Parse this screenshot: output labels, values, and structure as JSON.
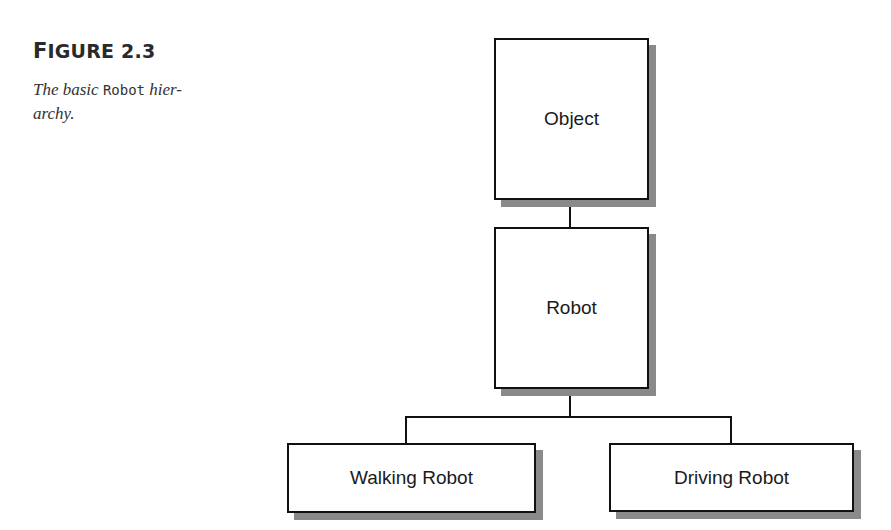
{
  "figure": {
    "label_initial": "F",
    "label_rest": "IGURE 2.3",
    "caption_before": "The basic ",
    "caption_code": "Robot",
    "caption_after": " hier-archy."
  },
  "diagram": {
    "nodes": [
      {
        "id": "object",
        "label": "Object"
      },
      {
        "id": "robot",
        "label": "Robot"
      },
      {
        "id": "walking-robot",
        "label": "Walking Robot"
      },
      {
        "id": "driving-robot",
        "label": "Driving Robot"
      }
    ],
    "edges": [
      {
        "from": "object",
        "to": "robot"
      },
      {
        "from": "robot",
        "to": "walking-robot"
      },
      {
        "from": "robot",
        "to": "driving-robot"
      }
    ]
  }
}
